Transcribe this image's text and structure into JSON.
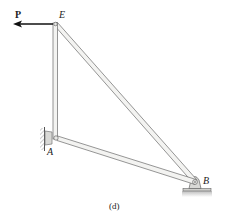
{
  "figure": {
    "caption": "(d)",
    "force": {
      "label": "P",
      "direction": "left"
    },
    "points": {
      "E": {
        "label": "E",
        "x": 55,
        "y": 24
      },
      "A": {
        "label": "A",
        "x": 56,
        "y": 138
      },
      "B": {
        "label": "B",
        "x": 195,
        "y": 182
      }
    },
    "members": [
      {
        "name": "EA",
        "from": "E",
        "to": "A"
      },
      {
        "name": "AB",
        "from": "A",
        "to": "B"
      },
      {
        "name": "EB",
        "from": "E",
        "to": "B"
      }
    ],
    "supports": [
      {
        "point": "A",
        "type": "pin-to-wall"
      },
      {
        "point": "B",
        "type": "pin-to-ground"
      }
    ],
    "colors": {
      "member_fill": "#f3f3f1",
      "member_edge": "#6a6a6a",
      "support_fill": "#d9d9d6",
      "ground": "#bdbdbd",
      "arrow": "#111111"
    }
  }
}
